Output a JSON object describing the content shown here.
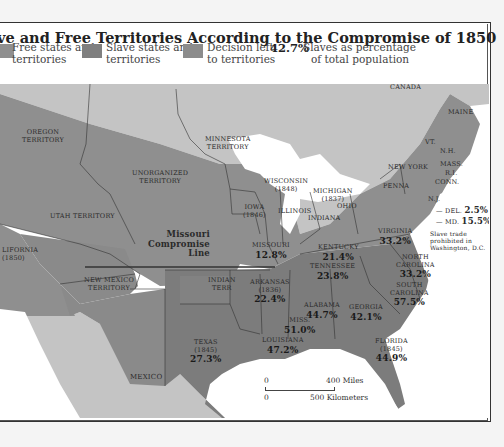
{
  "title": "ve and Free Territories According to the Compromise of 1850",
  "legend": {
    "items": [
      {
        "label_line1": "Free states and",
        "label_line2": "territories",
        "color": "#8f8f8f"
      },
      {
        "label_line1": "Slave states and",
        "label_line2": "territories",
        "color": "#7f7f7f"
      },
      {
        "label_line1": "Decision left",
        "label_line2": "to territories",
        "color": "#8c8c8c"
      }
    ],
    "pct_example": "42.7%",
    "pct_label_line1": "Slaves as percentage",
    "pct_label_line2": "of total population"
  },
  "regions": {
    "canada": "CANADA",
    "mexico": "MEXICO",
    "oregon": {
      "line1": "OREGON",
      "line2": "TERRITORY"
    },
    "minnesota": {
      "line1": "MINNESOTA",
      "line2": "TERRITORY"
    },
    "unorganized": {
      "line1": "UNORGANIZED",
      "line2": "TERRITORY"
    },
    "utah": "UTAH TERRITORY",
    "california": {
      "line1": "LIFORNIA",
      "line2": "(1850)"
    },
    "new_mexico": {
      "line1": "NEW MEXICO",
      "line2": "TERRITORY"
    },
    "indian": {
      "line1": "INDIAN",
      "line2": "TERR"
    },
    "wisconsin": {
      "line1": "WISCONSIN",
      "line2": "(1848)"
    },
    "michigan": {
      "line1": "MICHIGAN",
      "line2": "(1837)"
    },
    "iowa": {
      "line1": "IOWA",
      "line2": "(1846)"
    },
    "illinois": "ILLINOIS",
    "indiana": "INDIANA",
    "ohio": "OHIO",
    "penna": "PENNA",
    "new_york": "NEW YORK",
    "maine": "MAINE",
    "vt": "VT.",
    "nh": "N.H.",
    "mass": "MASS.",
    "ri": "R.I.",
    "conn": "CONN.",
    "nj": "N.J.",
    "del": {
      "name": "DEL.",
      "pct": "2.5%"
    },
    "md": {
      "name": "MD.",
      "pct": "15.5%"
    },
    "dc_note": {
      "line1": "Slave trade",
      "line2": "prohibited in",
      "line3": "Washington, D.C."
    },
    "missouri": {
      "name": "MISSOURI",
      "pct": "12.8%"
    },
    "kentucky": {
      "name": "KENTUCKY",
      "pct": "21.4%"
    },
    "virginia": {
      "name": "VIRGINIA",
      "pct": "33.2%"
    },
    "tennessee": {
      "name": "TENNESSEE",
      "pct": "23.8%"
    },
    "north_carolina": {
      "line1": "NORTH",
      "line2": "CAROLINA",
      "pct": "33.2%"
    },
    "south_carolina": {
      "line1": "SOUTH",
      "line2": "CAROLINA",
      "pct": "57.5%"
    },
    "arkansas": {
      "name": "ARKANSAS",
      "year": "(1836)",
      "pct": "22.4%"
    },
    "alabama": {
      "name": "ALABAMA",
      "pct": "44.7%"
    },
    "georgia": {
      "name": "GEORGIA",
      "pct": "42.1%"
    },
    "miss": {
      "name": "MISS.",
      "pct": "51.0%"
    },
    "louisiana": {
      "name": "LOUISIANA",
      "pct": "47.2%"
    },
    "florida": {
      "name": "FLORIDA",
      "year": "(1845)",
      "pct": "44.9%"
    },
    "texas": {
      "name": "TEXAS",
      "year": "(1845)",
      "pct": "27.3%"
    },
    "compromise_line": {
      "line1": "Missouri",
      "line2": "Compromise",
      "line3": "Line"
    }
  },
  "scale": {
    "zero_top": "0",
    "miles": "400 Miles",
    "zero_bottom": "0",
    "km": "500 Kilometers"
  },
  "colors": {
    "free": "#8f8f8f",
    "slave": "#7c7c7c",
    "undecided": "#8a8a8a",
    "foreign": "#c4c4c4",
    "water": "#ffffff"
  }
}
